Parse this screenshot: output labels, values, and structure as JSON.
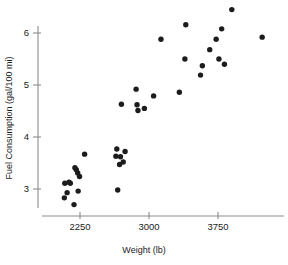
{
  "chart_data": {
    "type": "scatter",
    "title": "",
    "xlabel": "Weight (lb)",
    "ylabel": "Fuel Consumption (gal/100 mi)",
    "xlim": [
      1950,
      4350
    ],
    "ylim": [
      2.55,
      6.65
    ],
    "xticks": [
      2250,
      3000,
      3750
    ],
    "xtick_labels": [
      "2250",
      "3000",
      "3750"
    ],
    "yticks": [
      3,
      4,
      5,
      6
    ],
    "ytick_labels": [
      "3",
      "4",
      "5",
      "6"
    ],
    "grid": false,
    "legend": null,
    "marker": "filled-circle",
    "marker_color": "#1c1c1c",
    "axis_color": "#8c8c8c",
    "points": [
      {
        "x": 2080,
        "y": 2.83
      },
      {
        "x": 2085,
        "y": 3.11
      },
      {
        "x": 2110,
        "y": 2.93
      },
      {
        "x": 2130,
        "y": 3.13
      },
      {
        "x": 2145,
        "y": 3.11
      },
      {
        "x": 2185,
        "y": 2.7
      },
      {
        "x": 2195,
        "y": 3.41
      },
      {
        "x": 2210,
        "y": 3.37
      },
      {
        "x": 2225,
        "y": 3.31
      },
      {
        "x": 2230,
        "y": 2.96
      },
      {
        "x": 2245,
        "y": 3.24
      },
      {
        "x": 2300,
        "y": 3.67
      },
      {
        "x": 2640,
        "y": 3.63
      },
      {
        "x": 2650,
        "y": 3.77
      },
      {
        "x": 2660,
        "y": 2.98
      },
      {
        "x": 2680,
        "y": 3.47
      },
      {
        "x": 2690,
        "y": 3.62
      },
      {
        "x": 2700,
        "y": 4.63
      },
      {
        "x": 2720,
        "y": 3.52
      },
      {
        "x": 2740,
        "y": 3.72
      },
      {
        "x": 2860,
        "y": 4.92
      },
      {
        "x": 2870,
        "y": 4.62
      },
      {
        "x": 2880,
        "y": 4.51
      },
      {
        "x": 2950,
        "y": 4.55
      },
      {
        "x": 3050,
        "y": 4.79
      },
      {
        "x": 3130,
        "y": 5.88
      },
      {
        "x": 3330,
        "y": 4.86
      },
      {
        "x": 3390,
        "y": 5.5
      },
      {
        "x": 3400,
        "y": 6.16
      },
      {
        "x": 3560,
        "y": 5.19
      },
      {
        "x": 3580,
        "y": 5.37
      },
      {
        "x": 3660,
        "y": 5.68
      },
      {
        "x": 3730,
        "y": 5.88
      },
      {
        "x": 3760,
        "y": 5.5
      },
      {
        "x": 3790,
        "y": 6.08
      },
      {
        "x": 3820,
        "y": 5.4
      },
      {
        "x": 3900,
        "y": 6.45
      },
      {
        "x": 4230,
        "y": 5.92
      }
    ]
  }
}
